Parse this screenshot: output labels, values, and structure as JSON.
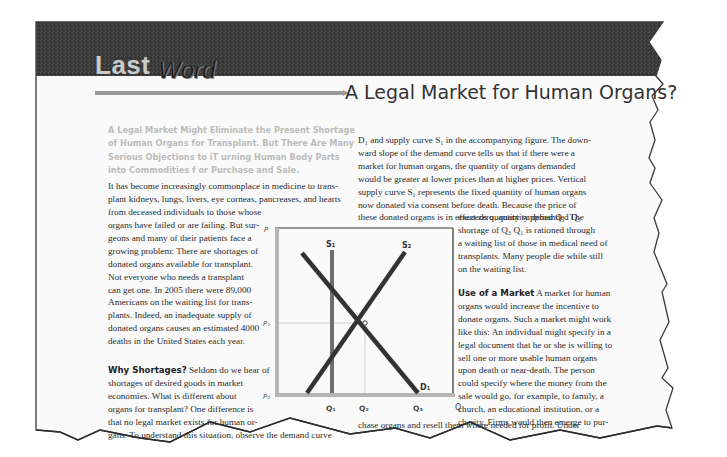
{
  "header": {
    "kicker_light": "Last",
    "kicker_dark": "Word",
    "title": "A Legal Market for Human Organs?"
  },
  "subhead": {
    "lines": [
      "A Legal Market Might Eliminate the Present Shortage",
      "of Human Organs for Transplant. But There Are Many",
      "Serious Objections to iT urning Human Body Parts",
      "into Commodities f or Purchase and Sale."
    ]
  },
  "left_column": {
    "intro_full_lines": [
      "It has become increasingly commonplace in medicine to trans-",
      "plant kidneys, lungs, livers, eye corneas, pancreases, and hearts",
      "from deceased individuals to those whose"
    ],
    "intro_wrapped_lines": [
      "organs have failed or are failing. But sur-",
      "geons and many of their patients face a",
      "growing problem: There are shortages of",
      "donated organs available for transplant.",
      "Not everyone who needs a transplant",
      "can get one. In 2005 there were 89,000",
      "Americans on the waiting list for trans-",
      "plants. Indeed, an inadequate supply of",
      "donated organs causes an estimated 4000",
      "deaths in the United States each year."
    ],
    "section_heading": "Why Shortages?",
    "section_lines": [
      " Seldom do we hear of",
      "shortages of desired goods in market",
      "economies. What is different about",
      "organs for transplant? One difference is",
      "that no legal market exists for human or-",
      "gans. To understand this situation, observe the demand curve"
    ]
  },
  "right_column": {
    "top_lines": [
      "D₁ and supply curve S₁ in the accompanying figure. The down-",
      "ward slope of the demand curve tells us that if there were a",
      "market for human organs, the quantity of organs demanded",
      "would be greater at lower prices than at higher prices. Vertical",
      "supply curve S₁ represents the fixed quantity of human organs",
      "now donated via consent before death. Because the price of",
      "these donated organs is in effect zero, quantity demanded Q₃"
    ],
    "wrapped_lines": [
      "exceeds quantity supplied Q₁. The",
      "shortage of Q₃    Q₁ is rationed through",
      "a waiting list of those in medical need of",
      "transplants. Many people die while still",
      "on the waiting list."
    ],
    "section_heading": "Use of a Market",
    "section_lines": [
      "  A market for human",
      "organs would increase the incentive to",
      "donate organs. Such a market might work",
      "like this: An individual might specify in a",
      "legal document that he or she is willing to",
      "sell one or more usable human organs",
      "upon death or near-death. The person",
      "could specify where the money from the",
      "sale would go, for example, to family, a",
      "church, an educational institution, or a",
      "charity. Firms would then emerge to pur-"
    ],
    "bottom_line": "chase organs and resell them where needed for profit. Under"
  },
  "figure": {
    "y_axis_label": "P",
    "x_axis_label": "Q",
    "price_ticks": [
      "P₁",
      "P₀"
    ],
    "quantity_ticks": [
      "Q₁",
      "Q₂",
      "Q₃"
    ],
    "curves": {
      "demand": "D₁",
      "supply_vertical": "S₁",
      "supply_upward": "S₂"
    },
    "colors": {
      "axis": "#b5b5b5",
      "curve": "#333333",
      "vertical_supply": "#6e6e6e",
      "guide": "#d0d0d0"
    }
  },
  "colors": {
    "header_band": "#3a3a3a",
    "page_bg": "#fafafa",
    "subhead": "#bcbcbc",
    "rule": "#9a9a9a"
  }
}
